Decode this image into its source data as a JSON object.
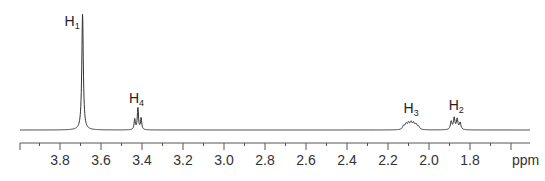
{
  "chart_data": {
    "type": "line",
    "title": "",
    "xlabel": "ppm",
    "ylabel": "",
    "xlim": [
      3.99,
      1.52
    ],
    "x_reversed": true,
    "grid": false,
    "axis": {
      "major_ticks": [
        3.8,
        3.6,
        3.4,
        3.2,
        3.0,
        2.8,
        2.6,
        2.4,
        2.2,
        2.0,
        1.8
      ],
      "tick_labels": [
        "3.8",
        "3.6",
        "3.4",
        "3.2",
        "3.0",
        "2.8",
        "2.6",
        "2.4",
        "2.2",
        "2.0",
        "1.8"
      ],
      "minor_tick_step": 0.1,
      "unit_label": "ppm"
    },
    "peaks": [
      {
        "label": "H",
        "sub": "1",
        "ppm": 3.69,
        "multiplicity": "singlet",
        "rel_height": 1.0
      },
      {
        "label": "H",
        "sub": "4",
        "ppm": 3.42,
        "multiplicity": "triplet",
        "rel_height": 0.19
      },
      {
        "label": "H",
        "sub": "3",
        "ppm": 2.09,
        "multiplicity": "multiplet",
        "rel_height": 0.06
      },
      {
        "label": "H",
        "sub": "2",
        "ppm": 1.87,
        "multiplicity": "multiplet",
        "rel_height": 0.1
      }
    ],
    "colors": {
      "trace": "#333333",
      "axis": "#555555",
      "text": "#222222"
    }
  }
}
